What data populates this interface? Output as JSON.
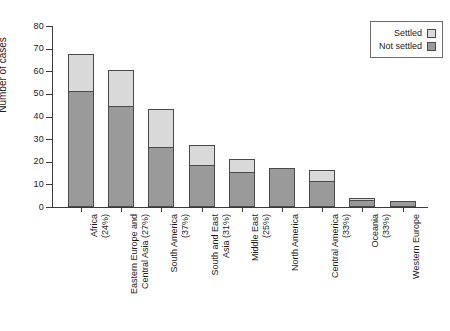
{
  "chart_data": {
    "type": "bar",
    "title": "",
    "xlabel": "",
    "ylabel": "Number of cases",
    "ylim": [
      0,
      80
    ],
    "yticks": [
      0,
      10,
      20,
      30,
      40,
      50,
      60,
      70,
      80
    ],
    "grid": false,
    "stacked": true,
    "legend_position": "top-right",
    "categories": [
      "Africa\n(24%)",
      "Eastern Europe and\nCentral Asia (27%)",
      "South America\n(37%)",
      "South and East\nAsia (31%)",
      "Middle East\n(25%)",
      "North America",
      "Central America\n(33%)",
      "Oceania\n(33%)",
      "Western Europe"
    ],
    "series": [
      {
        "name": "Not settled",
        "color": "#9a9a9a",
        "values": [
          51,
          44,
          26,
          18,
          15,
          17,
          11,
          2.5,
          2
        ]
      },
      {
        "name": "Settled",
        "color": "#d9d9d9",
        "values": [
          16,
          16,
          17,
          9,
          6,
          0,
          5,
          1,
          0
        ]
      }
    ],
    "totals": [
      67,
      60,
      43,
      27,
      21,
      17,
      16,
      3.5,
      2
    ]
  },
  "legend": {
    "items": [
      {
        "label": "Settled",
        "color": "#d9d9d9"
      },
      {
        "label": "Not settled",
        "color": "#9a9a9a"
      }
    ]
  },
  "axis": {
    "y_label": "Number of cases",
    "y_ticks": [
      "0",
      "10",
      "20",
      "30",
      "40",
      "50",
      "60",
      "70",
      "80"
    ]
  }
}
